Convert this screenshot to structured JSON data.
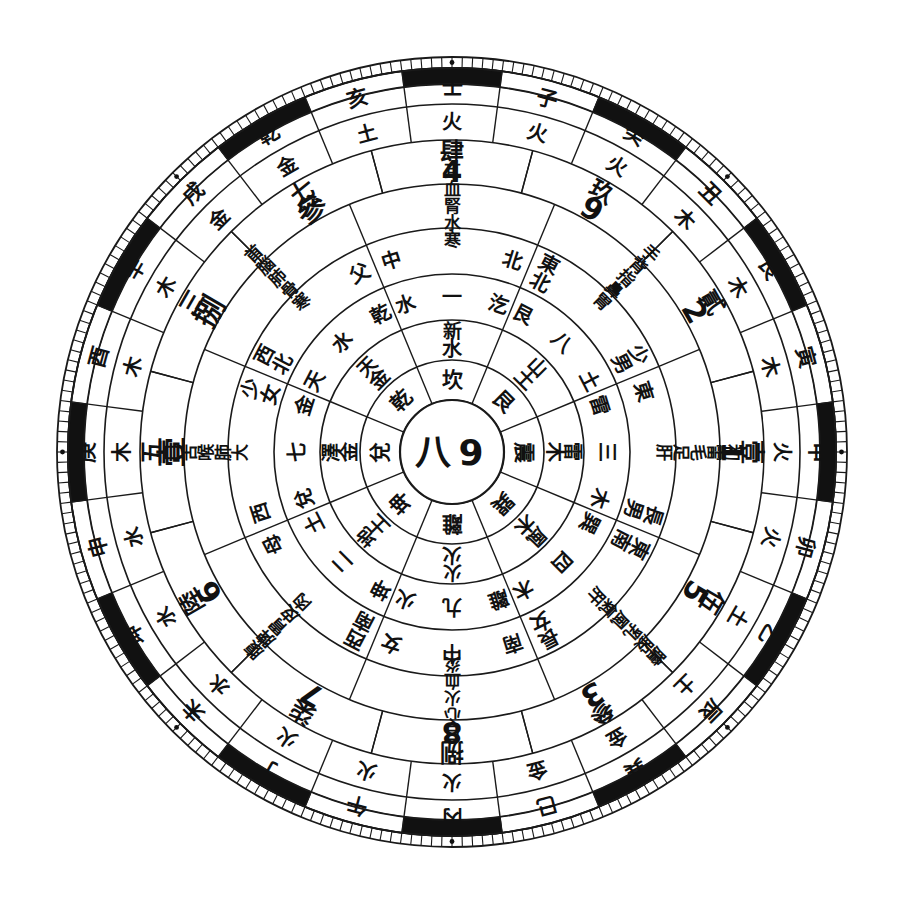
{
  "figure": {
    "kind": "concentric-ring-diagram",
    "background_color": "#ffffff",
    "ink_color": "#1a1a1a",
    "center": {
      "x": 452,
      "y": 452
    },
    "outer_radius": 395
  },
  "center_disc": {
    "name": "center-disc",
    "labels": [
      "八",
      "9"
    ]
  },
  "rings": [
    {
      "id": "ring-trigram",
      "name": "trigram-ring",
      "sectors": 8,
      "radius_inner": 52,
      "radius_outer": 92,
      "rotation_offset": -22.5,
      "font_size": 21,
      "upright": true,
      "labels": [
        "坎",
        "艮",
        "震",
        "巽",
        "離",
        "坤",
        "兌",
        "乾"
      ]
    },
    {
      "id": "ring-element-8",
      "name": "eight-element-ring",
      "sectors": 8,
      "radius_inner": 92,
      "radius_outer": 132,
      "rotation_offset": -22.5,
      "font_size": 20,
      "upright": true,
      "labels": [
        "水",
        "土",
        "木",
        "木",
        "火",
        "土",
        "金",
        "金"
      ]
    },
    {
      "id": "ring-nature-8",
      "name": "eight-nature-ring",
      "sectors": 8,
      "radius_inner": 92,
      "radius_outer": 132,
      "rotation_offset": -22.5,
      "font_size": 19,
      "upright": true,
      "second_labels": [
        "新",
        "山",
        "雷",
        "風",
        "火",
        "地",
        "澤",
        "天"
      ]
    },
    {
      "id": "ring-number-nature",
      "name": "number-nature-ring",
      "sectors": 8,
      "radius_inner": 132,
      "radius_outer": 178,
      "rotation_offset": -22.5,
      "font_size": 20,
      "upright": true,
      "labels": [
        "水 一 汔",
        "艮 八 土",
        "雷 三 木",
        "巽 四 木",
        "離 九 火",
        "坤 二 土",
        "兌 七 金",
        "天 水 乾"
      ]
    },
    {
      "id": "ring-direction-person",
      "name": "direction-and-person-ring",
      "sectors": 8,
      "radius_inner": 178,
      "radius_outer": 224,
      "rotation_offset": -22.5,
      "font_size": 20,
      "upright": true,
      "labels": [
        "中 北",
        "東北 少男",
        "東 長男",
        "東南 長女",
        "南 中 女",
        "西南 母",
        "西 少女",
        "西北 父"
      ]
    },
    {
      "id": "ring-body",
      "name": "body-part-ring",
      "sectors": 8,
      "radius_inner": 224,
      "radius_outer": 268,
      "rotation_offset": -22.5,
      "font_size": 17,
      "upright": true,
      "labels": [
        "耳血腎水寒",
        "手背指鼻胃",
        "初雷毛足肝",
        "膽股乳風氣肝",
        "目心火血炎",
        "腹脾胃皮肉",
        "口舌喉肺大",
        "首腦肺骨寒"
      ]
    },
    {
      "id": "ring-number-arabic",
      "name": "arabic-number-ring",
      "sectors": 12,
      "radius_inner": 268,
      "radius_outer": 312,
      "rotation_offset": -15,
      "font_size": 30,
      "upright": true,
      "labels": [
        "4",
        "9",
        "2",
        "1",
        "5",
        "3",
        "8",
        "7",
        "6",
        "壹",
        "捌",
        "參"
      ]
    },
    {
      "id": "ring-number-hanzi",
      "name": "hanzi-number-ring",
      "sectors": 12,
      "radius_inner": 268,
      "radius_outer": 312,
      "rotation_offset": -15,
      "font_size": 24,
      "upright": true,
      "labels": [
        "肆",
        "玖",
        "貳",
        "壹",
        "伍",
        "參",
        "捌",
        "柒",
        "陸",
        "五",
        "三",
        "七"
      ]
    },
    {
      "id": "ring-element-24",
      "name": "element-ring-24",
      "sectors": 24,
      "radius_inner": 312,
      "radius_outer": 348,
      "rotation_offset": -7.5,
      "font_size": 20,
      "upright": true,
      "labels": [
        "火",
        "火",
        "火",
        "木",
        "木",
        "木",
        "火",
        "火",
        "土",
        "土",
        "金",
        "金",
        "火",
        "火",
        "火",
        "水",
        "水",
        "水",
        "木",
        "木",
        "木",
        "金",
        "金",
        "土"
      ]
    },
    {
      "id": "ring-stem-branch",
      "name": "stem-branch-ring-24",
      "sectors": 24,
      "radius_inner": 348,
      "radius_outer": 384,
      "rotation_offset": -7.5,
      "font_size": 21,
      "upright": true,
      "labels": [
        "壬",
        "子",
        "癸",
        "丑",
        "艮",
        "寅",
        "甲",
        "卯",
        "乙",
        "辰",
        "巽",
        "巳",
        "丙",
        "午",
        "丁",
        "未",
        "坤",
        "申",
        "庚",
        "酉",
        "辛",
        "戌",
        "乾",
        "亥"
      ]
    }
  ],
  "tick_band": {
    "name": "degree-tick-band",
    "radius_inner": 384,
    "radius_outer": 395,
    "tick_count": 120,
    "marker_dots": 8
  },
  "segment_band": {
    "name": "alternating-segment-band",
    "radius_inner": 368,
    "radius_outer": 384,
    "segments": 24,
    "black_color": "#111111",
    "white_color": "#ffffff"
  },
  "legend": {
    "trigrams": [
      "乾",
      "兌",
      "離",
      "震",
      "巽",
      "坎",
      "艮",
      "坤"
    ],
    "five_elements": [
      "金",
      "木",
      "水",
      "火",
      "土"
    ],
    "heavenly_stems": [
      "甲",
      "乙",
      "丙",
      "丁",
      "戊",
      "己",
      "庚",
      "辛",
      "壬",
      "癸"
    ],
    "earthly_branches": [
      "子",
      "丑",
      "寅",
      "卯",
      "辰",
      "巳",
      "午",
      "未",
      "申",
      "酉",
      "戌",
      "亥"
    ],
    "directions": [
      "北",
      "東北",
      "東",
      "東南",
      "南",
      "西南",
      "西",
      "西北"
    ]
  }
}
